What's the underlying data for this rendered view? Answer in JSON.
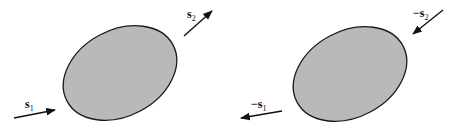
{
  "diagram": {
    "colors": {
      "fill": "#b9b9b9",
      "stroke": "#1a1a1a",
      "arrow": "#111111"
    },
    "panels": [
      {
        "name": "left",
        "arrows": [
          {
            "id": "s1",
            "base": "s",
            "sub": "1",
            "prefix": "",
            "direction": "incoming"
          },
          {
            "id": "s2",
            "base": "s",
            "sub": "2",
            "prefix": "",
            "direction": "outgoing"
          }
        ]
      },
      {
        "name": "right",
        "arrows": [
          {
            "id": "neg-s1",
            "base": "s",
            "sub": "1",
            "prefix": "−",
            "direction": "outgoing"
          },
          {
            "id": "neg-s2",
            "base": "s",
            "sub": "2",
            "prefix": "−",
            "direction": "incoming"
          }
        ]
      }
    ]
  }
}
